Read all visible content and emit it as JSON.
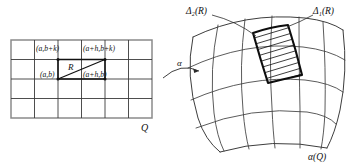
{
  "figure": {
    "caption_domain_label": "Q",
    "caption_image_label": "α(Q)",
    "map_label": "α",
    "rect_label": "R",
    "delta_1_label": "Δ₁(R)",
    "delta_2_label": "Δ₂(R)",
    "corner_labels": {
      "bottom_left": "(a,b)",
      "bottom_right": "(a+h,b)",
      "top_left": "(a,b+k)",
      "top_right": "(a+h,b+k)"
    },
    "colors": {
      "ink": "#111111",
      "grid": "#3a3a3a",
      "frame": "#8a8a8a",
      "background": "#ffffff"
    },
    "domain_grid": {
      "columns": 6,
      "rows": 4,
      "left": 11,
      "top": 40,
      "right": 152,
      "bottom": 118
    },
    "image_grid": {
      "columns": 6,
      "rows": 4,
      "description": "curved quadrilateral mesh, image of Q under alpha"
    },
    "highlighted_patch": {
      "fill_style": "diagonal-hatching",
      "description": "image of rectangle R under alpha"
    }
  }
}
